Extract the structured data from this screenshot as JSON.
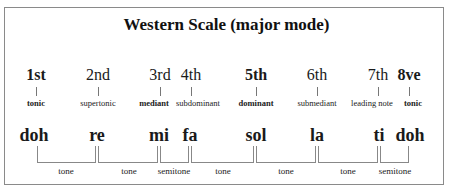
{
  "title": "Western Scale (major mode)",
  "degrees": [
    {
      "number": "1st",
      "role": "tonic",
      "bold": true
    },
    {
      "number": "2nd",
      "role": "supertonic",
      "bold": false
    },
    {
      "number": "3rd",
      "role": "mediant",
      "bold": true
    },
    {
      "number": "4th",
      "role": "subdominant",
      "bold": false
    },
    {
      "number": "5th",
      "role": "dominant",
      "bold": true
    },
    {
      "number": "6th",
      "role": "submediant",
      "bold": false
    },
    {
      "number": "7th",
      "role": "leading note",
      "bold": false
    },
    {
      "number": "8ve",
      "role": "tonic",
      "bold": true
    }
  ],
  "syllables": [
    "doh",
    "re",
    "mi",
    "fa",
    "sol",
    "la",
    "ti",
    "doh"
  ],
  "intervals": [
    "tone",
    "tone",
    "semitone",
    "tone",
    "tone",
    "tone",
    "semitone"
  ]
}
